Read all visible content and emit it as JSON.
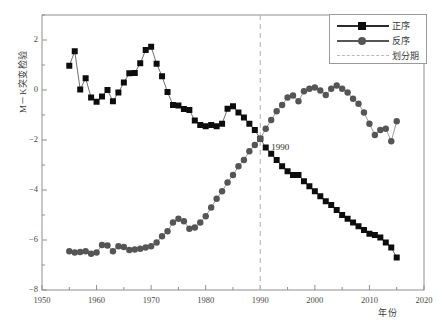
{
  "chart_data": {
    "type": "line",
    "title": "",
    "xlabel": "年份",
    "ylabel": "M－K突变检验",
    "xlim": [
      1950,
      2020
    ],
    "ylim": [
      -8,
      3
    ],
    "xticks": [
      1950,
      1960,
      1970,
      1980,
      1990,
      2000,
      2010,
      2020
    ],
    "yticks": [
      2,
      0,
      -2,
      -4,
      -6,
      -8
    ],
    "grid": false,
    "legend_position": "top-right",
    "legend": [
      "正序",
      "反序",
      "划分期"
    ],
    "annotations": [
      {
        "text": "1990",
        "x": 1992,
        "y": -2.35
      }
    ],
    "vlines": [
      {
        "x": 1990,
        "label": "划分期",
        "style": "dashed",
        "color": "#bcbcbc"
      }
    ],
    "series": [
      {
        "name": "正序",
        "marker": "square",
        "color": "#0d0d0d",
        "x": [
          1955,
          1956,
          1957,
          1958,
          1959,
          1960,
          1961,
          1962,
          1963,
          1964,
          1965,
          1966,
          1967,
          1968,
          1969,
          1970,
          1971,
          1972,
          1973,
          1974,
          1975,
          1976,
          1977,
          1978,
          1979,
          1980,
          1981,
          1982,
          1983,
          1984,
          1985,
          1986,
          1987,
          1988,
          1989,
          1990,
          1991,
          1992,
          1993,
          1994,
          1995,
          1996,
          1997,
          1998,
          1999,
          2000,
          2001,
          2002,
          2003,
          2004,
          2005,
          2006,
          2007,
          2008,
          2009,
          2010,
          2011,
          2012,
          2013,
          2014,
          2015
        ],
        "values": [
          0.97,
          1.55,
          0.02,
          0.47,
          -0.3,
          -0.47,
          -0.26,
          0.0,
          -0.45,
          -0.1,
          0.3,
          0.67,
          0.68,
          1.07,
          1.6,
          1.73,
          1.05,
          0.55,
          -0.08,
          -0.6,
          -0.62,
          -0.76,
          -0.8,
          -1.22,
          -1.4,
          -1.45,
          -1.4,
          -1.45,
          -1.35,
          -0.75,
          -0.65,
          -0.9,
          -1.1,
          -1.35,
          -1.6,
          -1.95,
          -2.3,
          -2.55,
          -2.8,
          -3.05,
          -3.25,
          -3.4,
          -3.4,
          -3.65,
          -3.85,
          -4.05,
          -4.25,
          -4.45,
          -4.6,
          -4.8,
          -5.0,
          -5.15,
          -5.3,
          -5.45,
          -5.6,
          -5.75,
          -5.8,
          -5.9,
          -6.1,
          -6.3,
          -6.7
        ]
      },
      {
        "name": "反序",
        "marker": "circle",
        "color": "#555555",
        "x": [
          1955,
          1956,
          1957,
          1958,
          1959,
          1960,
          1961,
          1962,
          1963,
          1964,
          1965,
          1966,
          1967,
          1968,
          1969,
          1970,
          1971,
          1972,
          1973,
          1974,
          1975,
          1976,
          1977,
          1978,
          1979,
          1980,
          1981,
          1982,
          1983,
          1984,
          1985,
          1986,
          1987,
          1988,
          1989,
          1990,
          1991,
          1992,
          1993,
          1994,
          1995,
          1996,
          1997,
          1998,
          1999,
          2000,
          2001,
          2002,
          2003,
          2004,
          2005,
          2006,
          2007,
          2008,
          2009,
          2010,
          2011,
          2012,
          2013,
          2014,
          2015
        ],
        "values": [
          -6.45,
          -6.5,
          -6.48,
          -6.45,
          -6.55,
          -6.5,
          -6.2,
          -6.22,
          -6.45,
          -6.25,
          -6.28,
          -6.4,
          -6.38,
          -6.35,
          -6.3,
          -6.25,
          -6.1,
          -5.85,
          -5.65,
          -5.3,
          -5.15,
          -5.25,
          -5.55,
          -5.5,
          -5.3,
          -5.05,
          -4.7,
          -4.35,
          -4.05,
          -3.7,
          -3.4,
          -3.05,
          -2.8,
          -2.45,
          -2.2,
          -1.95,
          -1.55,
          -1.2,
          -0.85,
          -0.6,
          -0.3,
          -0.22,
          -0.45,
          -0.05,
          0.05,
          0.1,
          -0.02,
          -0.2,
          0.05,
          0.18,
          0.05,
          -0.1,
          -0.35,
          -0.55,
          -0.9,
          -1.35,
          -1.8,
          -1.6,
          -1.55,
          -2.05,
          -1.25
        ]
      }
    ]
  }
}
